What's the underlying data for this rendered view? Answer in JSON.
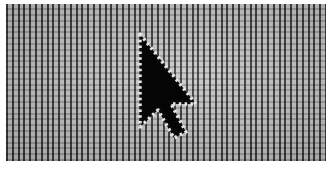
{
  "image": {
    "subject": "Close-up photo of a display pixel grid with a mouse pointer arrow",
    "palette": {
      "background": "#ffffff",
      "grid_light": "#c8c8c8",
      "grid_dark": "#2a2a2a",
      "cursor_fill": "#0a0a0a",
      "cursor_outline": "#e6e6e6"
    },
    "cursor": {
      "icon": "arrow-pointer-icon",
      "tip": [
        135,
        34
      ]
    }
  }
}
